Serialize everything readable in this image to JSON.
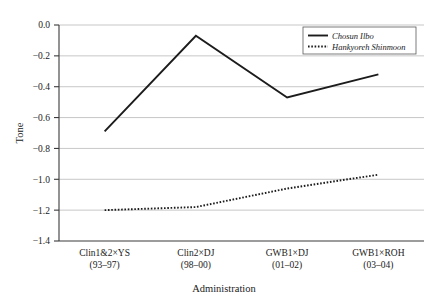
{
  "chart_data": {
    "type": "line",
    "title": "",
    "xlabel": "Administration",
    "ylabel": "Tone",
    "categories": [
      "Clin1&2×YS",
      "Clin2×DJ",
      "GWB1×DJ",
      "GWB1×ROH"
    ],
    "category_sublabels": [
      "(93–97)",
      "(98–00)",
      "(01–02)",
      "(03–04)"
    ],
    "ylim": [
      -1.4,
      0.0
    ],
    "yticks": [
      0.0,
      -0.2,
      -0.4,
      -0.6,
      -0.8,
      -1.0,
      -1.2,
      -1.4
    ],
    "ytick_labels": [
      "0.0",
      "−0.2",
      "−0.4",
      "−0.6",
      "−0.8",
      "−1.0",
      "−1.2",
      "−1.4"
    ],
    "grid": true,
    "grid_axis": "y",
    "legend_position": "top-right",
    "series": [
      {
        "name": "Chosun Ilbo",
        "style": "solid",
        "color": "#1c1c1c",
        "values": [
          -0.69,
          -0.07,
          -0.47,
          -0.32
        ]
      },
      {
        "name": "Hankyoreh Shinmoon",
        "style": "dotted",
        "color": "#1c1c1c",
        "values": [
          -1.2,
          -1.18,
          -1.06,
          -0.97
        ]
      }
    ]
  },
  "axes": {
    "y_title": "Tone",
    "x_title": "Administration"
  },
  "legend": {
    "entries": [
      {
        "label": "Chosun Ilbo"
      },
      {
        "label": "Hankyoreh Shinmoon"
      }
    ]
  },
  "yticks": {
    "t0": "0.0",
    "t1": "−0.2",
    "t2": "−0.4",
    "t3": "−0.6",
    "t4": "−0.8",
    "t5": "−1.0",
    "t6": "−1.2",
    "t7": "−1.4"
  },
  "xticks": {
    "c0": "Clin1&2×YS",
    "c0s": "(93–97)",
    "c1": "Clin2×DJ",
    "c1s": "(98–00)",
    "c2": "GWB1×DJ",
    "c2s": "(01–02)",
    "c3": "GWB1×ROH",
    "c3s": "(03–04)"
  }
}
